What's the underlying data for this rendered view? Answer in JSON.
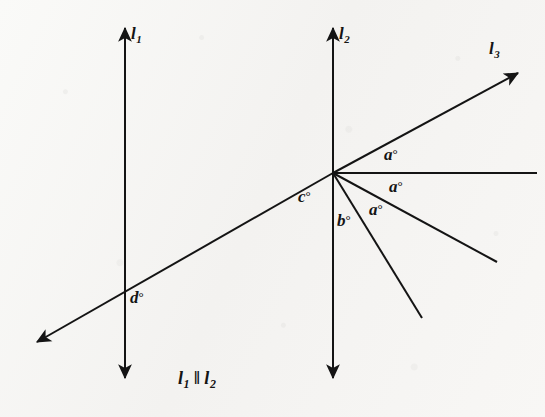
{
  "figure": {
    "background_color": "#f6f5f3",
    "ink_color": "#141414",
    "caption": {
      "left_line": "l",
      "left_sub": "1",
      "parallel_symbol": "‖",
      "right_line": "l",
      "right_sub": "2",
      "full_text": "l1 ‖ l2"
    },
    "line_labels": [
      {
        "name": "l1-label",
        "base": "l",
        "sub": "1",
        "x": 131,
        "y": 25
      },
      {
        "name": "l2-label",
        "base": "l",
        "sub": "2",
        "x": 339,
        "y": 25
      },
      {
        "name": "l3-label",
        "base": "l",
        "sub": "3",
        "x": 489,
        "y": 40
      }
    ],
    "angle_labels": [
      {
        "name": "angle-a-upper",
        "letter": "a",
        "degree": "°",
        "x": 384,
        "y": 146
      },
      {
        "name": "angle-a-middle",
        "letter": "a",
        "degree": "°",
        "x": 389,
        "y": 178
      },
      {
        "name": "angle-a-lower",
        "letter": "a",
        "degree": "°",
        "x": 369,
        "y": 201
      },
      {
        "name": "angle-b",
        "letter": "b",
        "degree": "°",
        "x": 337,
        "y": 212
      },
      {
        "name": "angle-c",
        "letter": "c",
        "degree": "°",
        "x": 298,
        "y": 188
      },
      {
        "name": "angle-d",
        "letter": "d",
        "degree": "°",
        "x": 130,
        "y": 289
      }
    ],
    "geometry": {
      "vertex": {
        "x": 333,
        "y": 173
      },
      "line_l1": {
        "x": 125,
        "y_top": 28,
        "y_bottom": 378,
        "arrows": "both"
      },
      "line_l2": {
        "x": 333,
        "y_top": 28,
        "y_bottom": 378,
        "arrows": "both"
      },
      "transversal": {
        "arrow_tip": {
          "x": 37,
          "y": 342
        },
        "through_l1": {
          "x": 125,
          "y": 290
        },
        "end": {
          "x": 333,
          "y": 173
        },
        "arrows": "start"
      },
      "ray_l3": {
        "from": {
          "x": 333,
          "y": 173
        },
        "to": {
          "x": 518,
          "y": 73
        },
        "arrow": "end"
      },
      "ray_horizontal": {
        "from": {
          "x": 333,
          "y": 173
        },
        "to": {
          "x": 537,
          "y": 173
        },
        "arrow": "none"
      },
      "ray_lower_shallow": {
        "from": {
          "x": 333,
          "y": 173
        },
        "to": {
          "x": 497,
          "y": 262
        },
        "arrow": "none"
      },
      "ray_lower_steep": {
        "from": {
          "x": 333,
          "y": 173
        },
        "to": {
          "x": 422,
          "y": 318
        },
        "arrow": "none"
      }
    }
  }
}
